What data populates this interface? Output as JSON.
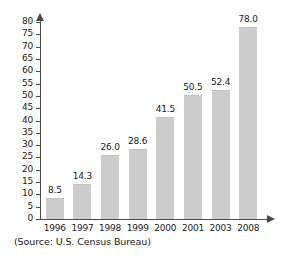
{
  "chart_data": {
    "type": "bar",
    "title": "",
    "subtitle": "",
    "xlabel": "",
    "ylabel": "",
    "categories": [
      "1996",
      "1997",
      "1998",
      "1999",
      "2000",
      "2001",
      "2003",
      "2008"
    ],
    "values": [
      8.5,
      14.3,
      26.0,
      28.6,
      41.5,
      50.5,
      52.4,
      78.0
    ],
    "value_labels": [
      "8.5",
      "14.3",
      "26.0",
      "28.6",
      "41.5",
      "50.5",
      "52.4",
      "78.0"
    ],
    "ylim": [
      0,
      80
    ],
    "y_ticks": [
      0,
      5,
      10,
      15,
      20,
      25,
      30,
      35,
      40,
      45,
      50,
      55,
      60,
      65,
      70,
      75,
      80
    ],
    "y_tick_labels": [
      "0",
      "5",
      "10",
      "15",
      "20",
      "25",
      "30",
      "35",
      "40",
      "45",
      "50",
      "55",
      "60",
      "65",
      "70",
      "75",
      "80"
    ],
    "grid": false,
    "legend": "none",
    "bar_color": "#cccccc",
    "axis_color": "#4a4a4a",
    "text_color": "#1a1a1a",
    "background_color": "#ffffff",
    "annotations": [
      "(Source: U.S. Census Bureau)"
    ]
  },
  "source": {
    "note": "(Source: U.S. Census Bureau)"
  }
}
